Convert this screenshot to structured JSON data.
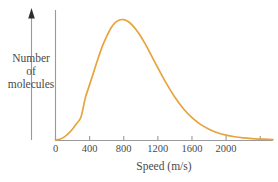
{
  "figure": {
    "axis_color": "#9a9a9a",
    "curve_color": "#e8a33d",
    "text_color": "#4a4a4a",
    "ylabel_lines": [
      "Number",
      "of",
      "molecules"
    ],
    "yaxis_arrow_icon": "up-arrow-icon"
  },
  "chart_data": {
    "type": "line",
    "title": "",
    "subtitle": "",
    "xlabel": "Speed (m/s)",
    "ylabel": "Number of molecules",
    "xlim": [
      0,
      2550
    ],
    "ylim": [
      0,
      1.08
    ],
    "grid": false,
    "legend": null,
    "annotations": [],
    "xticks": [
      0,
      400,
      800,
      1200,
      1600,
      2000,
      2400
    ],
    "xtick_labels": [
      "0",
      "400",
      "800",
      "1200",
      "1600",
      "2000",
      ""
    ],
    "yticks": [],
    "ytick_labels": [],
    "series": [
      {
        "name": "Maxwell-Boltzmann speed distribution",
        "x": [
          0,
          50,
          100,
          150,
          200,
          250,
          300,
          350,
          400,
          450,
          500,
          550,
          600,
          650,
          700,
          750,
          800,
          850,
          900,
          950,
          1000,
          1050,
          1100,
          1200,
          1300,
          1400,
          1500,
          1600,
          1700,
          1800,
          1900,
          2000,
          2100,
          2200,
          2300,
          2400,
          2500,
          2550
        ],
        "y": [
          0.0,
          0.006,
          0.024,
          0.053,
          0.092,
          0.139,
          0.193,
          0.35,
          0.46,
          0.57,
          0.68,
          0.78,
          0.86,
          0.93,
          0.975,
          0.997,
          1.0,
          0.985,
          0.955,
          0.912,
          0.86,
          0.8,
          0.735,
          0.6,
          0.47,
          0.355,
          0.26,
          0.185,
          0.13,
          0.09,
          0.06,
          0.04,
          0.027,
          0.018,
          0.012,
          0.008,
          0.005,
          0.004
        ]
      }
    ]
  }
}
